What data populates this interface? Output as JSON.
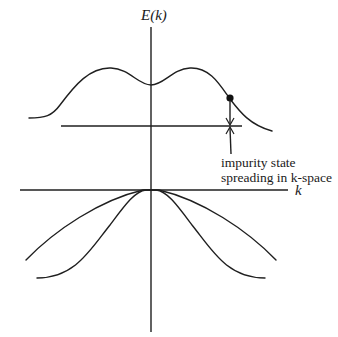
{
  "diagram": {
    "axes": {
      "y_label": "E(k)",
      "x_label": "k"
    },
    "bands": [
      {
        "name": "conduction-band",
        "description": "upper band with double maximum and central dip"
      },
      {
        "name": "valence-band-outer",
        "description": "lower band, broad parabola-like, maximum at k=0"
      },
      {
        "name": "valence-band-inner",
        "description": "lower band, narrower, maximum at k=0"
      }
    ],
    "impurity_level": {
      "description": "horizontal line below conduction band"
    },
    "annotation": {
      "line1": "impurity state",
      "line2": "spreading in k-space"
    },
    "colors": {
      "stroke": "#1f1f1f",
      "background": "#ffffff"
    }
  }
}
